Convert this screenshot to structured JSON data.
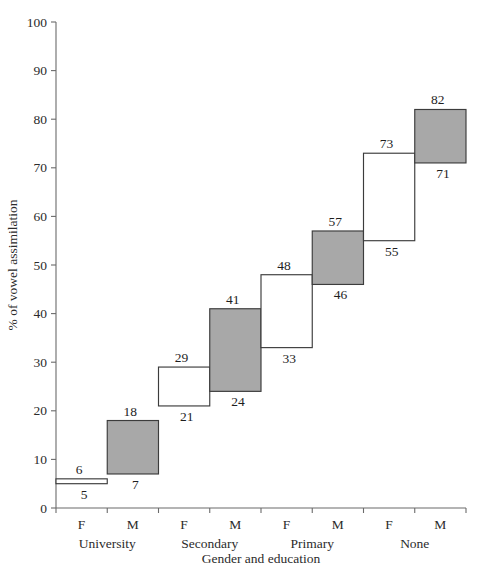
{
  "chart_data": {
    "type": "bar",
    "title": "",
    "xlabel": "Gender and education",
    "ylabel": "% of vowel assimilation",
    "ylim": [
      0,
      100
    ],
    "yticks": [
      0,
      10,
      20,
      30,
      40,
      50,
      60,
      70,
      80,
      90,
      100
    ],
    "ytick_labels": [
      "0",
      "10",
      "20",
      "30",
      "40",
      "50",
      "60",
      "70",
      "80",
      "90",
      "100"
    ],
    "grid": false,
    "legend": "none",
    "categories": [
      "F",
      "M",
      "F",
      "M",
      "F",
      "M",
      "F",
      "M"
    ],
    "groups": [
      "University",
      "Secondary",
      "Primary",
      "None"
    ],
    "series": [
      {
        "name": "vowel assimilation interval",
        "boxes": [
          {
            "index": 0,
            "group": "University",
            "gender": "F",
            "low": 5,
            "high": 6,
            "fill": "white",
            "low_label": "5",
            "high_label": "6"
          },
          {
            "index": 1,
            "group": "University",
            "gender": "M",
            "low": 7,
            "high": 18,
            "fill": "gray",
            "low_label": "7",
            "high_label": "18"
          },
          {
            "index": 2,
            "group": "Secondary",
            "gender": "F",
            "low": 21,
            "high": 29,
            "fill": "white",
            "low_label": "21",
            "high_label": "29"
          },
          {
            "index": 3,
            "group": "Secondary",
            "gender": "M",
            "low": 24,
            "high": 41,
            "fill": "gray",
            "low_label": "24",
            "high_label": "41"
          },
          {
            "index": 4,
            "group": "Primary",
            "gender": "F",
            "low": 33,
            "high": 48,
            "fill": "white",
            "low_label": "33",
            "high_label": "48"
          },
          {
            "index": 5,
            "group": "Primary",
            "gender": "M",
            "low": 46,
            "high": 57,
            "fill": "gray",
            "low_label": "46",
            "high_label": "57"
          },
          {
            "index": 6,
            "group": "None",
            "gender": "F",
            "low": 55,
            "high": 73,
            "fill": "white",
            "low_label": "55",
            "high_label": "73"
          },
          {
            "index": 7,
            "group": "None",
            "gender": "M",
            "low": 71,
            "high": 82,
            "fill": "gray",
            "low_label": "71",
            "high_label": "82"
          }
        ]
      }
    ],
    "colors": {
      "gray_fill": "#a8a8a8",
      "white_fill": "#ffffff",
      "box_stroke": "#3c3c3c",
      "axis": "#6b6b6b",
      "text": "#1e1e1e"
    }
  }
}
